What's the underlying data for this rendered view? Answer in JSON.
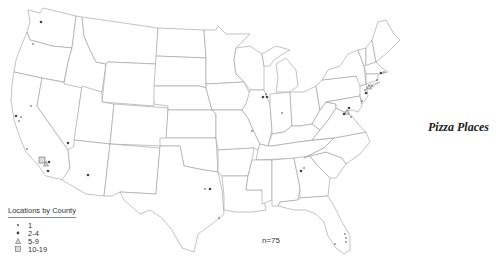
{
  "title": "Pizza Places",
  "legend": {
    "title": "Locations by County",
    "items": [
      {
        "label": "1",
        "symbol": "small-dot"
      },
      {
        "label": "2-4",
        "symbol": "large-dot"
      },
      {
        "label": "5-9",
        "symbol": "triangle"
      },
      {
        "label": "10-19",
        "symbol": "square"
      }
    ]
  },
  "n_label": "n=75",
  "colors": {
    "state_fill": "#ffffff",
    "state_stroke": "#9a9a9a",
    "marker": "#444444"
  },
  "markers": [
    {
      "region": "Seattle WA",
      "x": 41,
      "y": 22,
      "class": "2-4"
    },
    {
      "region": "Portland OR",
      "x": 33,
      "y": 44,
      "class": "1"
    },
    {
      "region": "Sacramento CA",
      "x": 31,
      "y": 106,
      "class": "1"
    },
    {
      "region": "SF Bay CA",
      "x": 16,
      "y": 116,
      "class": "2-4"
    },
    {
      "region": "SF Bay CA 2",
      "x": 21,
      "y": 117,
      "class": "1"
    },
    {
      "region": "San Jose CA",
      "x": 19,
      "y": 121,
      "class": "1"
    },
    {
      "region": "Central Coast CA",
      "x": 27,
      "y": 149,
      "class": "1"
    },
    {
      "region": "Los Angeles CA",
      "x": 42,
      "y": 160,
      "class": "10-19"
    },
    {
      "region": "Orange County CA",
      "x": 46,
      "y": 164,
      "class": "5-9"
    },
    {
      "region": "Riverside CA",
      "x": 49,
      "y": 162,
      "class": "2-4"
    },
    {
      "region": "San Diego CA",
      "x": 48,
      "y": 171,
      "class": "2-4"
    },
    {
      "region": "Las Vegas NV",
      "x": 68,
      "y": 143,
      "class": "2-4"
    },
    {
      "region": "Phoenix AZ",
      "x": 88,
      "y": 175,
      "class": "2-4"
    },
    {
      "region": "Dallas TX",
      "x": 205,
      "y": 189,
      "class": "1"
    },
    {
      "region": "Dallas TX 2",
      "x": 210,
      "y": 189,
      "class": "2-4"
    },
    {
      "region": "Houston TX",
      "x": 219,
      "y": 218,
      "class": "1"
    },
    {
      "region": "St Louis MO",
      "x": 252,
      "y": 131,
      "class": "1"
    },
    {
      "region": "Chicago IL",
      "x": 263,
      "y": 97,
      "class": "2-4"
    },
    {
      "region": "Chicago IL 2",
      "x": 267,
      "y": 97,
      "class": "2-4"
    },
    {
      "region": "Chicago IL 3",
      "x": 266,
      "y": 94,
      "class": "1"
    },
    {
      "region": "Indianapolis IN",
      "x": 282,
      "y": 113,
      "class": "1"
    },
    {
      "region": "Atlanta GA",
      "x": 301,
      "y": 171,
      "class": "2-4"
    },
    {
      "region": "Atlanta GA 2",
      "x": 304,
      "y": 168,
      "class": "1"
    },
    {
      "region": "DC area",
      "x": 347,
      "y": 112,
      "class": "5-9"
    },
    {
      "region": "Baltimore MD",
      "x": 349,
      "y": 108,
      "class": "2-4"
    },
    {
      "region": "Northern VA",
      "x": 344,
      "y": 114,
      "class": "2-4"
    },
    {
      "region": "Virginia",
      "x": 351,
      "y": 117,
      "class": "1"
    },
    {
      "region": "Philadelphia PA",
      "x": 365,
      "y": 90,
      "class": "1"
    },
    {
      "region": "New York NY",
      "x": 369,
      "y": 87,
      "class": "5-9"
    },
    {
      "region": "New Jersey",
      "x": 366,
      "y": 93,
      "class": "2-4"
    },
    {
      "region": "Long Island NY",
      "x": 372,
      "y": 86,
      "class": "1"
    },
    {
      "region": "Connecticut",
      "x": 377,
      "y": 80,
      "class": "1"
    },
    {
      "region": "Boston MA",
      "x": 381,
      "y": 73,
      "class": "2-4"
    },
    {
      "region": "Boston MA 2",
      "x": 384,
      "y": 72,
      "class": "1"
    },
    {
      "region": "Delaware",
      "x": 362,
      "y": 101,
      "class": "1"
    },
    {
      "region": "Tampa FL",
      "x": 335,
      "y": 244,
      "class": "1"
    },
    {
      "region": "Orlando FL",
      "x": 345,
      "y": 234,
      "class": "1"
    },
    {
      "region": "Palm Beach FL",
      "x": 346,
      "y": 238,
      "class": "1"
    },
    {
      "region": "Miami FL",
      "x": 346,
      "y": 242,
      "class": "1"
    }
  ]
}
